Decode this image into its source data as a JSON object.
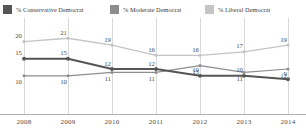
{
  "legend": {
    "items": [
      {
        "label": "% Conservative Democrat",
        "color": "#555555",
        "icon": "legend-swatch-icon"
      },
      {
        "label": "% Moderate Democrat",
        "color": "#8d8d8d",
        "icon": "legend-swatch-icon"
      },
      {
        "label": "% Liberal Democrat",
        "color": "#c4c4c4",
        "icon": "legend-swatch-icon"
      }
    ]
  },
  "axis": {
    "x_ticks": [
      "2008",
      "2009",
      "2010",
      "2011",
      "2012",
      "2013",
      "2014"
    ]
  },
  "chart_data": {
    "type": "line",
    "title": "",
    "subtitle": "",
    "xlabel": "",
    "ylabel": "",
    "categories": [
      "2008",
      "2009",
      "2010",
      "2011",
      "2012",
      "2013",
      "2014"
    ],
    "x": [
      2008,
      2009,
      2010,
      2011,
      2012,
      2013,
      2014
    ],
    "ylim": [
      0,
      24
    ],
    "grid": "vertical",
    "legend_position": "top",
    "data_labels": true,
    "series": [
      {
        "name": "% Conservative Democrat",
        "color": "#555555",
        "values": [
          15,
          15,
          12,
          12,
          10,
          10,
          9
        ],
        "label_position": "above"
      },
      {
        "name": "% Moderate Democrat",
        "color": "#8d8d8d",
        "values": [
          10,
          10,
          11,
          11,
          13,
          11,
          12
        ],
        "label_position": "below"
      },
      {
        "name": "% Liberal Democrat",
        "color": "#c4c4c4",
        "values": [
          20,
          21,
          19,
          16,
          16,
          17,
          19
        ],
        "label_position": "above"
      }
    ]
  }
}
